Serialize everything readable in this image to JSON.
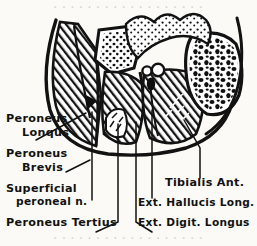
{
  "figure": {
    "background_color": "#fbfaf7",
    "ink_color": "#121212",
    "width": 257,
    "height": 246
  },
  "labels": {
    "peroneus_longus": {
      "line1": "Peroneus",
      "line2": "Lonqus",
      "x": 6,
      "y1": 122,
      "y2": 136
    },
    "peroneus_brevis": {
      "line1": "Peroneus",
      "line2": "Brevis",
      "x": 6,
      "y1": 157,
      "y2": 171
    },
    "superficial_peroneal_n": {
      "line1": "Superficial",
      "line2": "peroneal n.",
      "x": 6,
      "y1": 192,
      "y2": 205
    },
    "peroneus_tertius": {
      "line1": "Peroneus Tertius",
      "x": 6,
      "y1": 226
    },
    "tibialis_ant": {
      "line1": "Tibialis Ant.",
      "x": 165,
      "y1": 186
    },
    "ext_hallucis_long": {
      "line1": "Ext. Hallucis Long.",
      "x": 140,
      "y1": 206
    },
    "ext_digit_longus": {
      "line1": "Ext. Digit. Longus",
      "x": 140,
      "y1": 226
    }
  },
  "structures": {
    "deep_fascia": "outer-boundary",
    "fibula": "lateral-bone",
    "tibia": "medial-bone",
    "anterior_tibial_vessels": "vessel-cluster",
    "interosseous_membrane": "septum",
    "anterior_intermuscular_septum": "septum",
    "posterior_intermuscular_septum": "septum"
  },
  "scan_artifacts": {
    "top_ghost_text": "· · · · · · · · · · · · · · · · · ·",
    "bottom_ghost_text": "· · · · · · · · · · · · · · · · · ·"
  }
}
